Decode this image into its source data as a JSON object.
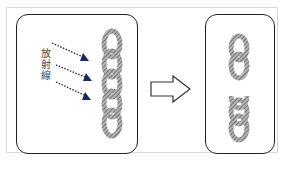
{
  "figure": {
    "before_panel": {
      "label": "放射線",
      "rays": 3,
      "chain_links": 5,
      "ray_color": "#1a2a5a"
    },
    "transition": {
      "icon": "right-arrow-outline"
    },
    "after_panel": {
      "chain_segments": 2,
      "state": "broken chain"
    },
    "colors": {
      "panel_border": "#222222",
      "frame_border": "#d8d8d8",
      "chain_fill": "#8a8a8a"
    }
  }
}
